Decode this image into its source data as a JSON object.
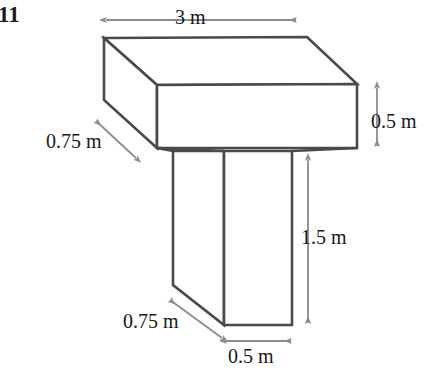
{
  "question": {
    "number": "11"
  },
  "figure": {
    "kind": "3d-t-shaped-prism",
    "stroke_color": "#4a4a4a",
    "arrow_color": "#8c8c8c",
    "fill_color": "#ffffff",
    "labels": {
      "top_width": "3 m",
      "right_height": "0.5 m",
      "upper_depth": "0.75 m",
      "stem_height": "1.5 m",
      "lower_depth": "0.75 m",
      "stem_width": "0.5 m"
    },
    "dimensions": [
      {
        "name": "top-width",
        "value": "3 m",
        "orientation": "horizontal"
      },
      {
        "name": "bar-height",
        "value": "0.5 m",
        "orientation": "vertical"
      },
      {
        "name": "bar-depth",
        "value": "0.75 m",
        "orientation": "diagonal"
      },
      {
        "name": "stem-height",
        "value": "1.5 m",
        "orientation": "vertical"
      },
      {
        "name": "stem-depth",
        "value": "0.75 m",
        "orientation": "diagonal"
      },
      {
        "name": "stem-width",
        "value": "0.5 m",
        "orientation": "horizontal"
      }
    ]
  }
}
